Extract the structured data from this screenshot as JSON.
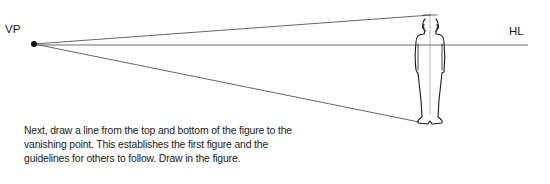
{
  "diagram": {
    "vanishing_point": {
      "label": "VP",
      "x": 34,
      "y": 44
    },
    "horizon_line": {
      "label": "HL",
      "y": 45,
      "x_start": 34,
      "x_end": 528
    },
    "guidelines": [
      {
        "name": "top-guideline",
        "from": [
          34,
          44
        ],
        "to": [
          430,
          15
        ]
      },
      {
        "name": "bottom-guideline",
        "from": [
          34,
          44
        ],
        "to": [
          418,
          122
        ]
      }
    ],
    "figure": {
      "description": "standing human figure, front view",
      "center_x": 430,
      "top_y": 15,
      "bottom_y": 124
    }
  },
  "caption": "Next, draw a line from the top and bottom of the figure to the vanishing point. This establishes the first figure and the guidelines for others to follow. Draw in the figure.",
  "colors": {
    "ink": "#1a1a1a",
    "guideline": "#555555"
  }
}
